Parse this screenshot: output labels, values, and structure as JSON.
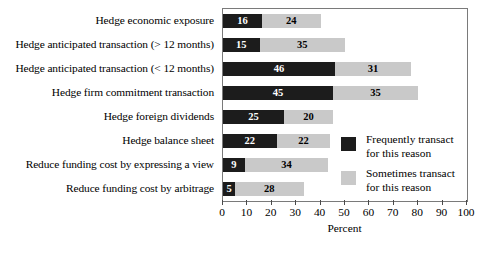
{
  "chart_data": {
    "type": "bar",
    "orientation": "horizontal",
    "stacked": true,
    "title": "",
    "xlabel": "Percent",
    "ylabel": "",
    "xlim": [
      0,
      100
    ],
    "xticks": [
      0,
      10,
      20,
      30,
      40,
      50,
      60,
      70,
      80,
      90,
      100
    ],
    "grid": false,
    "legend_position": "inside-right",
    "categories": [
      "Hedge economic exposure",
      "Hedge anticipated transaction (> 12 months)",
      "Hedge anticipated transaction (< 12 months)",
      "Hedge firm commitment transaction",
      "Hedge foreign dividends",
      "Hedge balance sheet",
      "Reduce funding cost by expressing a view",
      "Reduce funding cost by arbitrage"
    ],
    "series": [
      {
        "name": "Frequently transact for this reason",
        "color": "#1c1c1c",
        "values": [
          16,
          15,
          46,
          45,
          25,
          22,
          9,
          5
        ]
      },
      {
        "name": "Sometimes transact for this reason",
        "color": "#c9c9c9",
        "values": [
          24,
          35,
          31,
          35,
          20,
          22,
          34,
          28
        ]
      }
    ]
  },
  "legend": {
    "items": [
      {
        "label": "Frequently transact\nfor this reason",
        "swatch": "dark"
      },
      {
        "label": "Sometimes transact\nfor this reason",
        "swatch": "light"
      }
    ]
  },
  "axis": {
    "title": "Percent",
    "ticks": [
      "0",
      "10",
      "20",
      "30",
      "40",
      "50",
      "60",
      "70",
      "80",
      "90",
      "100"
    ]
  }
}
